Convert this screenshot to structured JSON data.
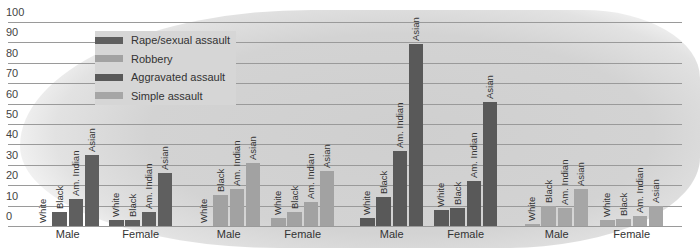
{
  "chart_data": {
    "type": "bar",
    "title": "",
    "xlabel": "",
    "ylabel": "",
    "ylim": [
      0,
      100
    ],
    "yticks": [
      0,
      10,
      20,
      30,
      40,
      50,
      60,
      70,
      80,
      90,
      100
    ],
    "grid": true,
    "legend_position": "upper-left",
    "legend": [
      "Rape/sexual assault",
      "Robbery",
      "Aggravated assault",
      "Simple assault"
    ],
    "race_categories": [
      "White",
      "Black",
      "Am. Indian",
      "Asian"
    ],
    "sex_categories": [
      "Male",
      "Female"
    ],
    "series": [
      {
        "name": "Rape/sexual assault",
        "color": "#5f5f5f",
        "Male": [
          0,
          7,
          13,
          35
        ],
        "Female": [
          3,
          3,
          7,
          26
        ]
      },
      {
        "name": "Robbery",
        "color": "#a2a2a2",
        "Male": [
          0,
          15,
          18,
          31
        ],
        "Female": [
          4,
          7,
          12,
          27
        ]
      },
      {
        "name": "Aggravated assault",
        "color": "#595959",
        "Male": [
          4,
          14,
          37,
          89
        ],
        "Female": [
          8,
          9,
          22,
          61
        ]
      },
      {
        "name": "Simple assault",
        "color": "#a6a6a6",
        "Male": [
          1,
          10,
          9,
          18
        ],
        "Female": [
          3,
          3.5,
          5,
          10
        ]
      }
    ]
  },
  "labels": {
    "yticks": [
      "100",
      "90",
      "80",
      "70",
      "60",
      "50",
      "40",
      "30",
      "20",
      "10",
      "0"
    ],
    "legend": [
      "Rape/sexual assault",
      "Robbery",
      "Aggravated assault",
      "Simple assault"
    ],
    "races": [
      "White",
      "Black",
      "Am. Indian",
      "Asian"
    ],
    "male": "Male",
    "female": "Female"
  }
}
